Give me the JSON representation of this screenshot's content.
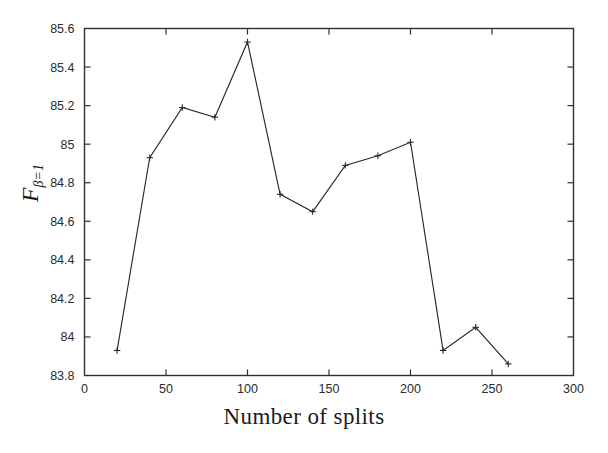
{
  "chart_data": {
    "type": "line",
    "title": "",
    "xlabel": "Number of splits",
    "ylabel": "F",
    "ylabel_subscript": "β=1",
    "x": [
      20,
      40,
      60,
      80,
      100,
      120,
      140,
      160,
      180,
      200,
      220,
      240,
      260
    ],
    "values": [
      83.93,
      84.93,
      85.19,
      85.14,
      85.53,
      84.74,
      84.65,
      84.89,
      84.94,
      85.01,
      83.93,
      84.05,
      83.86
    ],
    "series": [
      {
        "name": "F-beta=1 vs number of splits",
        "values": [
          83.93,
          84.93,
          85.19,
          85.14,
          85.53,
          84.74,
          84.65,
          84.89,
          84.94,
          85.01,
          83.93,
          84.05,
          83.86
        ]
      }
    ],
    "xlim": [
      0,
      300
    ],
    "ylim": [
      83.8,
      85.6
    ],
    "xticks": [
      0,
      50,
      100,
      150,
      200,
      250,
      300
    ],
    "xtick_labels": [
      "0",
      "50",
      "100",
      "150",
      "200",
      "250",
      "300"
    ],
    "yticks": [
      83.8,
      84.0,
      84.2,
      84.4,
      84.6,
      84.8,
      85.0,
      85.2,
      85.4,
      85.6
    ],
    "ytick_labels": [
      "83.8",
      "84",
      "84.2",
      "84.4",
      "84.6",
      "84.8",
      "85",
      "85.2",
      "85.4",
      "85.6"
    ],
    "grid": false,
    "legend": null,
    "marker": "plus",
    "line_color": "#2a2a2a",
    "background_color": "#ffffff"
  }
}
